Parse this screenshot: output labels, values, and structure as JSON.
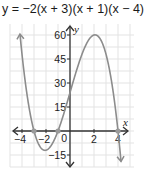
{
  "title": "y = −2(x + 3)(x + 1)(x − 4)",
  "colors": {
    "grid": "#e3e3e3",
    "axis": "#333333",
    "curve": "#8c8c8c",
    "zero_marker": "#9a9a9a",
    "text": "#222222"
  },
  "chart_data": {
    "type": "line",
    "title": "y = −2(x + 3)(x + 1)(x − 4)",
    "xlabel": "x",
    "ylabel": "y",
    "xlim": [
      -5,
      5
    ],
    "ylim": [
      -22,
      65
    ],
    "grid": true,
    "x_ticks": [
      -4,
      -2,
      0,
      2,
      4
    ],
    "x_tick_labels": [
      "−4",
      "−2",
      "0",
      "2",
      "4"
    ],
    "y_ticks": [
      -15,
      15,
      30,
      45,
      60
    ],
    "y_tick_labels": [
      "−15",
      "15",
      "30",
      "45",
      "60"
    ],
    "series": [
      {
        "name": "y = −2(x + 3)(x + 1)(x − 4)",
        "x": [
          -4.5,
          -4,
          -3,
          -2,
          -1,
          0,
          1,
          2,
          3,
          4,
          4.3
        ],
        "y": [
          73.5,
          40,
          0,
          -12,
          0,
          24,
          48,
          60,
          48,
          0,
          -21.3
        ]
      }
    ],
    "zeros": [
      -3,
      -1,
      4
    ],
    "annotations": {
      "y_intercept": 24,
      "local_max": [
        2.08,
        60.1
      ],
      "local_min": [
        -2.08,
        -12.1
      ]
    }
  }
}
